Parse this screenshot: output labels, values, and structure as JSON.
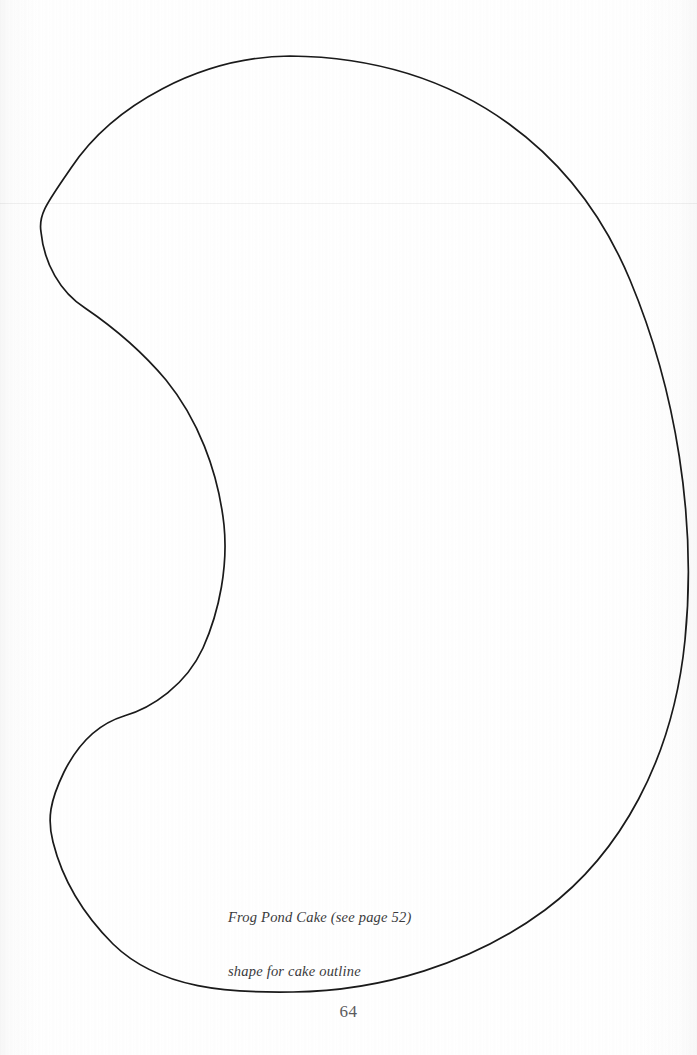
{
  "page": {
    "width": 697,
    "height": 1055,
    "background_color": "#ffffff",
    "paper_tint": "#fcfcfc",
    "number": "64",
    "fold_line_y": 203,
    "fold_line_color": "#0000000e"
  },
  "template": {
    "name": "cake-outline-template",
    "stroke_color": "#1a1a1a",
    "stroke_width": 1.7,
    "fill": "none",
    "description": "kidney-bean / crescent shaped cake outline",
    "bounds": {
      "left": 41,
      "right": 688,
      "top": 56,
      "bottom": 993
    },
    "key_points": {
      "top_apex": [
        290,
        56
      ],
      "upper_left_extreme": [
        41,
        225
      ],
      "upper_inflection": [
        103,
        320
      ],
      "notch_peak": [
        224,
        552
      ],
      "lower_inflection": [
        100,
        728
      ],
      "lower_left_extreme": [
        51,
        822
      ],
      "bottom_apex": [
        293,
        992
      ],
      "right_extreme": [
        688,
        556
      ]
    },
    "path": "M 290 56 C 200 57 113 105 71 168 C 48 202 38 214 41 232 C 44 263 60 292 85 308 C 110 325 140 349 166 380 C 197 418 218 470 224 525 C 228 565 220 610 203 648 C 186 685 152 708 124 716 C 98 724 78 744 64 772 C 50 801 47 819 53 842 C 62 878 82 913 113 944 C 160 990 232 993 293 992 C 380 991 472 964 545 910 C 620 854 673 760 685 640 C 697 520 676 390 630 280 C 580 160 470 58 290 56 Z"
  },
  "caption": {
    "line1": "Frog Pond Cake (see page 52)",
    "line2": "shape for cake outline",
    "color": "#3a3a3c",
    "style": "italic-serif",
    "x": 228,
    "y": 872
  }
}
